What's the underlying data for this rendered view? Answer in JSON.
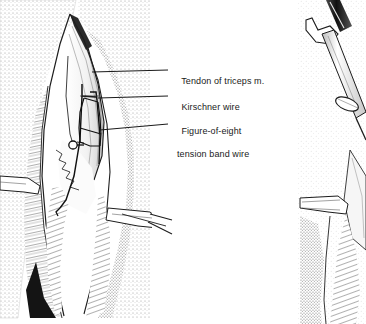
{
  "figure": {
    "kind": "medical-illustration",
    "panels": [
      {
        "name": "left-panel",
        "description": "Posterior elbow surgical exposure: retracted skin, triceps tendon, olecranon with two Kirschner wires and figure-of-eight tension band wire"
      },
      {
        "name": "right-panel",
        "description": "Partial view of wire driver instrument advancing a pin at the olecranon"
      }
    ]
  },
  "labels": [
    {
      "id": "tendon",
      "text": "Tendon of triceps m.",
      "text_line2": "",
      "x": 171,
      "y": 64,
      "leader_y": 70,
      "leader_x1": 110,
      "leader_x2": 168
    },
    {
      "id": "kwire",
      "text": "Kirschner wire",
      "text_line2": "",
      "x": 171,
      "y": 90,
      "leader_y": 96,
      "leader_x1": 110,
      "leader_x2": 168
    },
    {
      "id": "tensionband",
      "text": "Figure-of-eight",
      "text_line2": "tension band wire",
      "x": 171,
      "y": 114,
      "leader_y": 124,
      "leader_x1": 110,
      "leader_x2": 168
    }
  ],
  "colors": {
    "background": "#ffffff",
    "ink": "#1a1a1a",
    "line": "#222222",
    "stipple": "#9a9a9a",
    "shade_light": "#d8d8d8",
    "shade_dark": "#4a4a4a",
    "text": "#1a1a1a"
  },
  "canvas": {
    "width": 366,
    "height": 324
  }
}
